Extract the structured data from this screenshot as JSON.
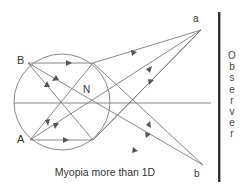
{
  "diagram": {
    "caption": "Myopia more than 1D",
    "labels": {
      "B": "B",
      "A": "A",
      "N": "N",
      "a": "a",
      "b": "b"
    },
    "observer_letters": [
      "O",
      "b",
      "s",
      "e",
      "r",
      "v",
      "e",
      "r"
    ],
    "observer_label": "Observer",
    "colors": {
      "line": "#777777",
      "arrow": "#555555",
      "observer_bar": "#333333",
      "text": "#333333"
    }
  }
}
